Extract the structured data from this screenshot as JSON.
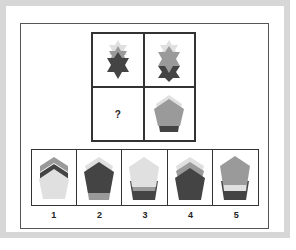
{
  "puzzle": {
    "grid": [
      {
        "id": "top-left",
        "shape": "stacked-six-point-stars",
        "layers": [
          "light",
          "mid",
          "dark"
        ]
      },
      {
        "id": "top-right",
        "shape": "stacked-six-point-stars",
        "layers": [
          "light",
          "mid-large",
          "dark"
        ]
      },
      {
        "id": "bottom-left",
        "label": "?"
      },
      {
        "id": "bottom-right",
        "shape": "stacked-pentagons",
        "layers": [
          "light",
          "mid-large",
          "dark"
        ]
      }
    ],
    "question_mark": "?",
    "options": [
      {
        "label": "1",
        "layers": [
          "mid",
          "dark",
          "light-large"
        ]
      },
      {
        "label": "2",
        "layers": [
          "light",
          "dark-large",
          "mid-bottom"
        ]
      },
      {
        "label": "3",
        "layers": [
          "light-large",
          "mid",
          "dark"
        ]
      },
      {
        "label": "4",
        "layers": [
          "light",
          "mid",
          "dark-large"
        ]
      },
      {
        "label": "5",
        "layers": [
          "mid-large",
          "light",
          "dark"
        ]
      }
    ]
  },
  "colors": {
    "frame": "#d7d7d7",
    "light": "#e0e0e0",
    "mid": "#9a9a9a",
    "dark": "#444444",
    "border": "#333333"
  }
}
